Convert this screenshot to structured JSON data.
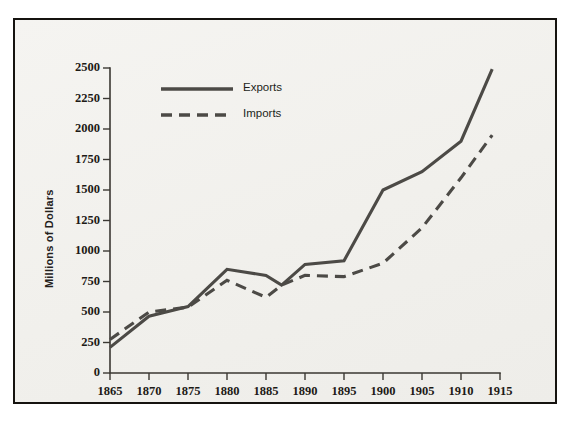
{
  "chart_data": {
    "type": "line",
    "title": "",
    "xlabel": "",
    "ylabel": "Millions of Dollars",
    "xlim": [
      1865,
      1915
    ],
    "ylim": [
      0,
      2500
    ],
    "grid": false,
    "legend_position": "top-left-inside",
    "xticks": [
      1865,
      1870,
      1875,
      1880,
      1885,
      1890,
      1895,
      1900,
      1905,
      1910,
      1915
    ],
    "xtick_labels": [
      "1865",
      "1870",
      "1875",
      "1880",
      "1885",
      "1890",
      "1895",
      "1900",
      "1905",
      "1910",
      "1915"
    ],
    "yticks": [
      0,
      250,
      500,
      750,
      1000,
      1250,
      1500,
      1750,
      2000,
      2250,
      2500
    ],
    "ytick_labels": [
      "0",
      "250",
      "500",
      "750",
      "1000",
      "1250",
      "1500",
      "1750",
      "2000",
      "2250",
      "2500"
    ],
    "series": [
      {
        "name": "Exports",
        "style": "solid",
        "color": "#4c4a46",
        "x": [
          1865,
          1870,
          1875,
          1880,
          1885,
          1887,
          1890,
          1895,
          1900,
          1905,
          1910,
          1914
        ],
        "values": [
          210,
          465,
          545,
          850,
          800,
          720,
          890,
          920,
          1500,
          1650,
          1900,
          2490
        ]
      },
      {
        "name": "Imports",
        "style": "dashed",
        "color": "#4c4a46",
        "x": [
          1865,
          1870,
          1875,
          1880,
          1885,
          1887,
          1890,
          1895,
          1900,
          1905,
          1910,
          1914
        ],
        "values": [
          275,
          500,
          540,
          760,
          620,
          720,
          800,
          790,
          900,
          1190,
          1600,
          1950
        ]
      }
    ]
  },
  "legend": {
    "entries": [
      {
        "label": "Exports",
        "style": "solid"
      },
      {
        "label": "Imports",
        "style": "dashed"
      }
    ]
  },
  "axes": {
    "y_axis_title": "Millions of Dollars"
  },
  "colors": {
    "frame": "#15130f",
    "plot_background": "#f3f2ef",
    "line": "#4c4a46",
    "axis": "#3b3833",
    "text": "#1d1a16"
  }
}
